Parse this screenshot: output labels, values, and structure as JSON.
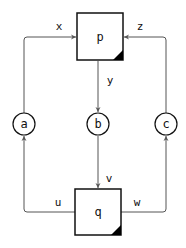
{
  "diagram": {
    "type": "flow",
    "nodes": {
      "p": {
        "label": "p",
        "shape": "square"
      },
      "q": {
        "label": "q",
        "shape": "square"
      },
      "a": {
        "label": "a",
        "shape": "circle"
      },
      "b": {
        "label": "b",
        "shape": "circle"
      },
      "c": {
        "label": "c",
        "shape": "circle"
      }
    },
    "edges": {
      "x": {
        "label": "x",
        "from": "a",
        "to": "p"
      },
      "z": {
        "label": "z",
        "from": "c",
        "to": "p"
      },
      "y": {
        "label": "y",
        "from": "p",
        "to": "b"
      },
      "v": {
        "label": "v",
        "from": "b",
        "to": "q"
      },
      "u": {
        "label": "u",
        "from": "q",
        "to": "a"
      },
      "w": {
        "label": "w",
        "from": "q",
        "to": "c"
      }
    },
    "colors": {
      "stroke": "#111111",
      "edge": "#555555",
      "corner_fill": "#000000"
    }
  }
}
